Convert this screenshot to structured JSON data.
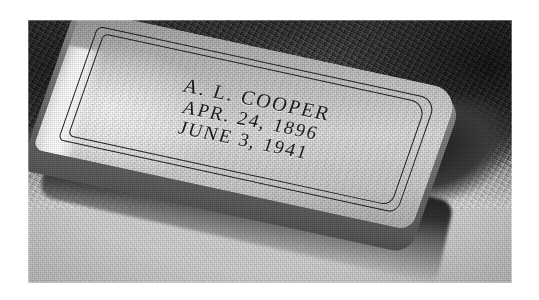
{
  "photo": {
    "kind": "photograph",
    "medium": "black-and-white halftone print",
    "subject": "flat granite grave marker set in grass beside a concrete apron",
    "alt": "Grainy black-and-white photograph of a flat granite grave marker inscribed A. L. COOPER, APR. 24, 1896, JUNE 3, 1941, lying in grass next to a concrete walkway, with a small round token resting on the ground to the left."
  },
  "marker": {
    "inscription": {
      "name": "A. L. COOPER",
      "birth": "APR. 24, 1896",
      "death": "JUNE 3, 1941"
    },
    "border_style": "incised double rectangle"
  },
  "token": {
    "shape": "circle",
    "line1": "THE",
    "line2": "HALL",
    "line3": "BELL",
    "legible": "false"
  },
  "scene": {
    "ground_left": "grass",
    "ground_right": "concrete",
    "shadow": "cast shadow under marker"
  },
  "colors": {
    "print_white": "#ffffff",
    "stone_light": "#e2e2e2",
    "stone_mid": "#b5b5b5",
    "stone_shadow": "#5d5d5d",
    "turf_dark": "#2a2a2a",
    "concrete": "#d0d0d0",
    "engraving": "#2b2b2b"
  }
}
